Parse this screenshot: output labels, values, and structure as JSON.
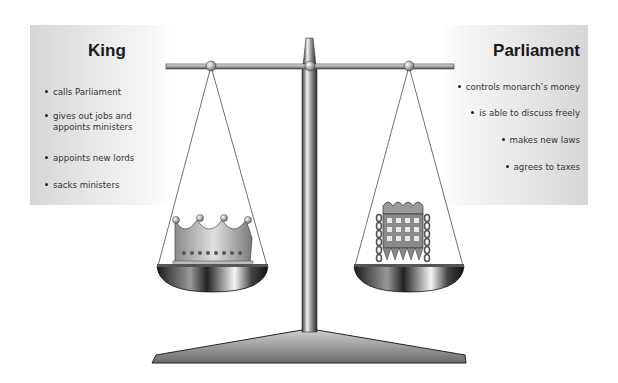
{
  "king": {
    "title": "King",
    "items": [
      {
        "line1": "calls Parliament"
      },
      {
        "line1": "gives out jobs and",
        "line2": "appoints ministers"
      },
      {
        "line1": "appoints new lords"
      },
      {
        "line1": "sacks ministers"
      }
    ],
    "pan_icon": "crown-icon"
  },
  "parliament": {
    "title": "Parliament",
    "items": [
      {
        "line1": "controls monarch’s money"
      },
      {
        "line1": "is able to discuss freely"
      },
      {
        "line1": "makes new laws"
      },
      {
        "line1": "agrees to taxes"
      }
    ],
    "pan_icon": "portcullis-icon"
  },
  "colors": {
    "panel_gray": "#d6d6d6",
    "metal_dark": "#2a2a2a",
    "metal_light": "#e8e8e8"
  }
}
